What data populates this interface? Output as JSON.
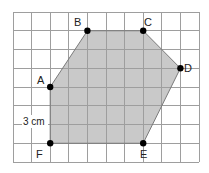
{
  "diagram": {
    "type": "hexagon-on-square-grid",
    "grid": {
      "columns": 10,
      "rows": 8,
      "origin_px": [
        13,
        12
      ],
      "cell_w_px": 18.6,
      "cell_h_px": 18.75,
      "line_color": "#a3a3a3",
      "line_color_shaded": "#8c8c8c"
    },
    "shape": {
      "fill": "#c9c9c9",
      "stroke": "#777777",
      "vertices": [
        {
          "label": "A",
          "col": 2,
          "row": 4
        },
        {
          "label": "B",
          "col": 4,
          "row": 1
        },
        {
          "label": "C",
          "col": 7,
          "row": 1
        },
        {
          "label": "D",
          "col": 9,
          "row": 3
        },
        {
          "label": "E",
          "col": 7,
          "row": 7
        },
        {
          "label": "F",
          "col": 2,
          "row": 7
        }
      ]
    },
    "labels": {
      "A": "A",
      "B": "B",
      "C": "C",
      "D": "D",
      "E": "E",
      "F": "F",
      "length": "3 cm"
    },
    "point_color": "#000000"
  }
}
